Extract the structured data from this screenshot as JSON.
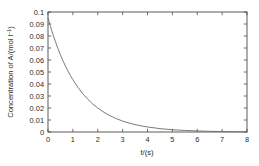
{
  "chart_data": {
    "type": "line",
    "title": "",
    "subtitle": "",
    "xlabel": "t/(s)",
    "ylabel": "Concentration of A/(mol l⁻¹)",
    "ylabel_main": "Concentration of A/(mol l",
    "ylabel_sup": "–1",
    "ylabel_tail": ")",
    "xlim": [
      0,
      8
    ],
    "ylim": [
      0,
      0.1
    ],
    "xticks": [
      0,
      1,
      2,
      3,
      4,
      5,
      6,
      7,
      8
    ],
    "xticklabels": [
      "0",
      "1",
      "2",
      "3",
      "4",
      "5",
      "6",
      "7",
      "8"
    ],
    "yticks": [
      0,
      0.01,
      0.02,
      0.03,
      0.04,
      0.05,
      0.06,
      0.07,
      0.08,
      0.09,
      0.1
    ],
    "yticklabels": [
      "0",
      "0.01",
      "0.02",
      "0.03",
      "0.04",
      "0.05",
      "0.06",
      "0.07",
      "0.08",
      "0.09",
      "0.1"
    ],
    "grid": false,
    "legend": null,
    "legend_position": "none",
    "frame": "box",
    "annotations": [],
    "series": [
      {
        "name": "Concentration of A",
        "color": "#6b6b6b",
        "model": "exponential decay",
        "x": [
          0.0,
          0.1,
          0.2,
          0.3,
          0.4,
          0.5,
          0.6,
          0.7,
          0.8,
          0.9,
          1.0,
          1.2,
          1.4,
          1.6,
          1.8,
          2.0,
          2.25,
          2.5,
          2.75,
          3.0,
          3.25,
          3.5,
          3.75,
          4.0,
          4.5,
          5.0,
          5.5,
          6.0,
          6.5,
          7.0,
          7.5,
          8.0
        ],
        "y": [
          0.095,
          0.0879,
          0.0813,
          0.0752,
          0.0695,
          0.0643,
          0.0595,
          0.055,
          0.0509,
          0.0471,
          0.0436,
          0.0373,
          0.0319,
          0.0273,
          0.0233,
          0.02,
          0.0164,
          0.0135,
          0.0111,
          0.0091,
          0.0075,
          0.0062,
          0.0051,
          0.0042,
          0.0028,
          0.0019,
          0.0013,
          0.00087,
          0.00058,
          0.00039,
          0.00026,
          0.00018
        ]
      }
    ]
  },
  "plot_geometry": {
    "left_px": 48,
    "right_px": 247,
    "top_px": 12,
    "bottom_px": 132
  }
}
